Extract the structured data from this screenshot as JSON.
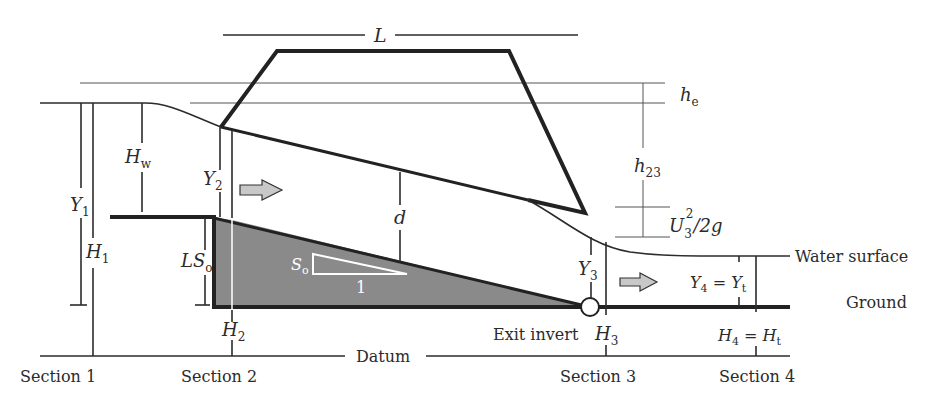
{
  "diagram": {
    "labels": {
      "length": "L",
      "entrance_loss": "h",
      "entrance_loss_sub": "e",
      "friction_loss": "h",
      "friction_loss_sub": "23",
      "velocity_head_main": "U",
      "velocity_head_sub": "3",
      "velocity_head_sup": "2",
      "velocity_head_tail": "/2g",
      "headwater": "H",
      "headwater_sub": "w",
      "y1": "Y",
      "y1_sub": "1",
      "h1": "H",
      "h1_sub": "1",
      "y2": "Y",
      "y2_sub": "2",
      "h2": "H",
      "h2_sub": "2",
      "drop": "LS",
      "drop_sub": "o",
      "slope": "S",
      "slope_sub": "o",
      "slope_run": "1",
      "diameter": "d",
      "y3": "Y",
      "y3_sub": "3",
      "h3": "H",
      "h3_sub": "3",
      "y4_left": "Y",
      "y4_left_sub": "4",
      "y4_eq": " = ",
      "y4_right": "Y",
      "y4_right_sub": "t",
      "h4_left": "H",
      "h4_left_sub": "4",
      "h4_eq": " = ",
      "h4_right": "H",
      "h4_right_sub": "t",
      "water_surface": "Water surface",
      "ground": "Ground",
      "exit_invert": "Exit invert",
      "datum": "Datum"
    },
    "sections": [
      "Section 1",
      "Section 2",
      "Section 3",
      "Section 4"
    ],
    "colors": {
      "line": "#222222",
      "fill": "#8a8a8a",
      "arrow_fill": "#c8c8c8",
      "background": "#ffffff"
    }
  }
}
